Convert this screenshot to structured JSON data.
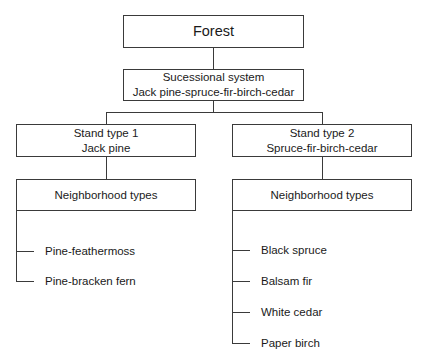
{
  "diagram": {
    "root": {
      "label": "Forest"
    },
    "system": {
      "title": "Sucessional system",
      "subtitle": "Jack pine-spruce-fir-birch-cedar"
    },
    "stands": [
      {
        "title": "Stand type 1",
        "subtitle": "Jack pine",
        "group_label": "Neighborhood types",
        "neighborhoods": [
          "Pine-feathermoss",
          "Pine-bracken fern"
        ]
      },
      {
        "title": "Stand type 2",
        "subtitle": "Spruce-fir-birch-cedar",
        "group_label": "Neighborhood types",
        "neighborhoods": [
          "Black spruce",
          "Balsam fir",
          "White cedar",
          "Paper birch"
        ]
      }
    ]
  },
  "colors": {
    "line": "#3a3a3a",
    "text": "#1a1a1a",
    "background": "#ffffff"
  }
}
